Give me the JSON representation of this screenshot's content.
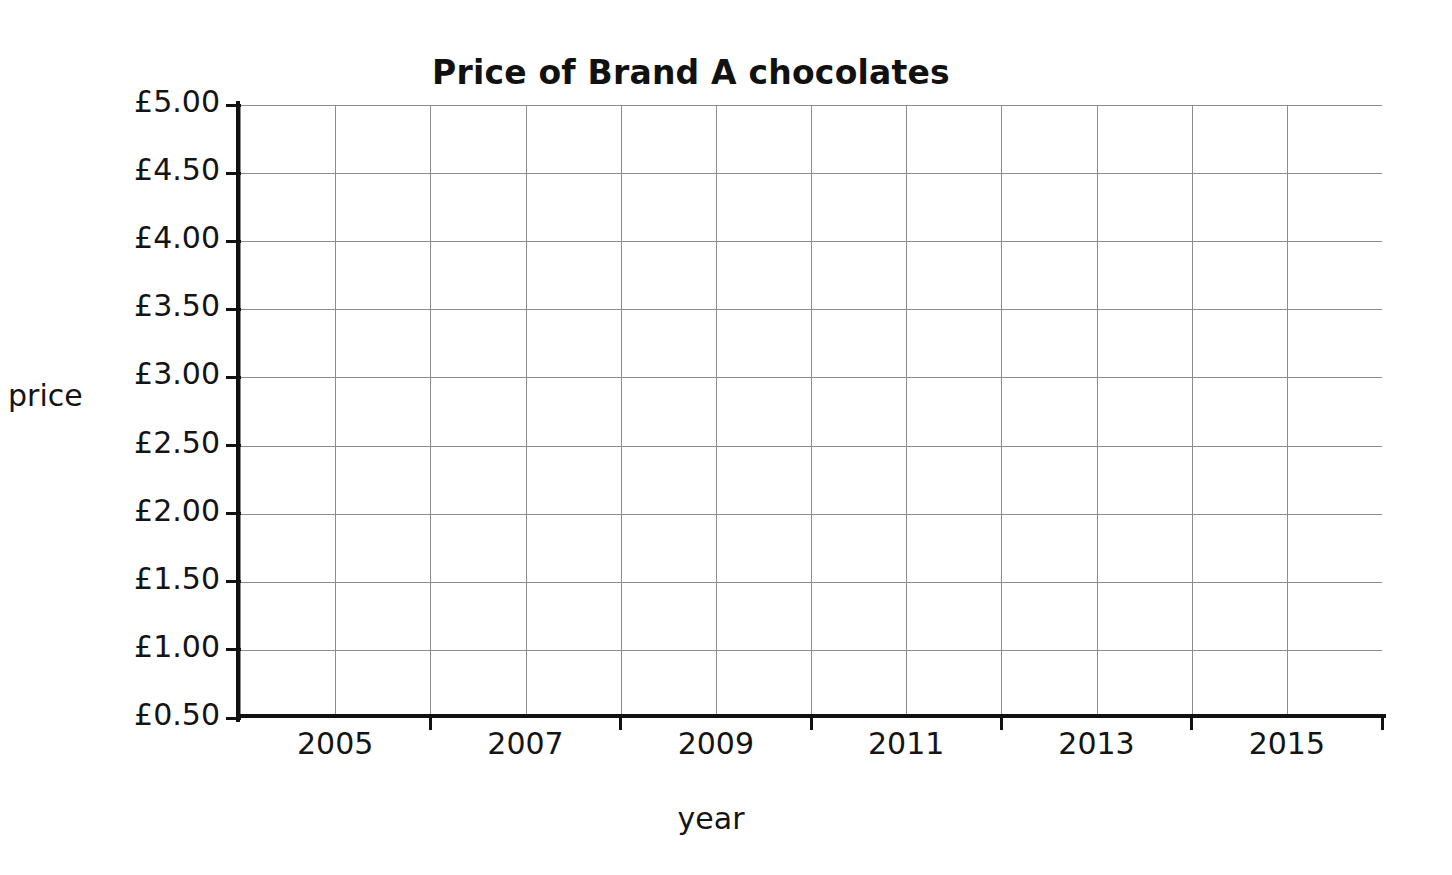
{
  "chart_data": {
    "type": "line",
    "title": "Price of Brand A chocolates",
    "xlabel": "year",
    "ylabel": "price",
    "grid": true,
    "legend": false,
    "series": [],
    "values": [],
    "x": [],
    "note": "Blank axes template — no data plotted",
    "xlim": [
      2004,
      2016
    ],
    "ylim": [
      0.5,
      5.0
    ],
    "y_tick_step": 0.5,
    "x_tick_step": 1,
    "y_tick_labels": [
      "£5.00",
      "£4.50",
      "£4.00",
      "£3.50",
      "£3.00",
      "£2.50",
      "£2.00",
      "£1.50",
      "£1.00",
      "£0.50"
    ],
    "y_tick_values": [
      5.0,
      4.5,
      4.0,
      3.5,
      3.0,
      2.5,
      2.0,
      1.5,
      1.0,
      0.5
    ],
    "x_tick_labels": [
      "2005",
      "2007",
      "2009",
      "2011",
      "2013",
      "2015"
    ],
    "x_tick_values": [
      2005,
      2007,
      2009,
      2011,
      2013,
      2015
    ],
    "x_minor_divisions": 12,
    "y_minor_divisions": 9,
    "colors": {
      "background": "#ffffff",
      "axis": "#111111",
      "grid": "#8c8c8c",
      "text": "#141414"
    }
  }
}
